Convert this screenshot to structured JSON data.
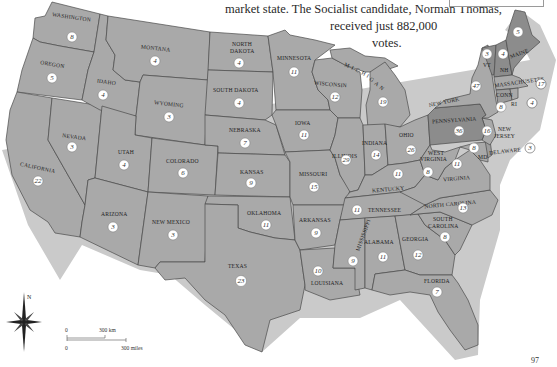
{
  "caption": {
    "lines": [
      "market state. The Socialist candidate, Norman Thomas,",
      "received just 882,000",
      "votes."
    ]
  },
  "colors": {
    "land": "#a9a9a9",
    "hoover_states": "#8c8c8c",
    "coast_halo": "#c9c9c9",
    "border": "#4a4a4a",
    "circle_fill": "#ffffff"
  },
  "states": [
    {
      "name": "WASHINGTON",
      "votes": "8"
    },
    {
      "name": "OREGON",
      "votes": "5"
    },
    {
      "name": "CALIFORNIA",
      "votes": "22"
    },
    {
      "name": "IDAHO",
      "votes": "4"
    },
    {
      "name": "NEVADA",
      "votes": "3"
    },
    {
      "name": "MONTANA",
      "votes": "4"
    },
    {
      "name": "WYOMING",
      "votes": "3"
    },
    {
      "name": "UTAH",
      "votes": "4"
    },
    {
      "name": "ARIZONA",
      "votes": "3"
    },
    {
      "name": "COLORADO",
      "votes": "6"
    },
    {
      "name": "NEW MEXICO",
      "votes": "3"
    },
    {
      "name": "NORTH DAKOTA",
      "votes": "4"
    },
    {
      "name": "SOUTH DAKOTA",
      "votes": "4"
    },
    {
      "name": "NEBRASKA",
      "votes": "7"
    },
    {
      "name": "KANSAS",
      "votes": "9"
    },
    {
      "name": "OKLAHOMA",
      "votes": "11"
    },
    {
      "name": "TEXAS",
      "votes": "23"
    },
    {
      "name": "MINNESOTA",
      "votes": "11"
    },
    {
      "name": "IOWA",
      "votes": "11"
    },
    {
      "name": "MISSOURI",
      "votes": "15"
    },
    {
      "name": "ARKANSAS",
      "votes": "9"
    },
    {
      "name": "LOUISIANA",
      "votes": "10"
    },
    {
      "name": "WISCONSIN",
      "votes": "12"
    },
    {
      "name": "MICHIGAN",
      "votes": "19"
    },
    {
      "name": "ILLINOIS",
      "votes": "29"
    },
    {
      "name": "INDIANA",
      "votes": "14"
    },
    {
      "name": "OHIO",
      "votes": "26"
    },
    {
      "name": "KENTUCKY",
      "votes": "11"
    },
    {
      "name": "TENNESSEE",
      "votes": "11"
    },
    {
      "name": "MISSISSIPPI",
      "votes": "9"
    },
    {
      "name": "ALABAMA",
      "votes": "11"
    },
    {
      "name": "GEORGIA",
      "votes": "12"
    },
    {
      "name": "FLORIDA",
      "votes": "7"
    },
    {
      "name": "SOUTH CAROLINA",
      "votes": "8"
    },
    {
      "name": "NORTH CAROLINA",
      "votes": "13"
    },
    {
      "name": "VIRGINIA",
      "votes": "11"
    },
    {
      "name": "WEST VIRGINIA",
      "votes": "8"
    },
    {
      "name": "PENNSYLVANIA",
      "votes": "36"
    },
    {
      "name": "NEW YORK",
      "votes": "47"
    },
    {
      "name": "NEW JERSEY",
      "votes": "16"
    },
    {
      "name": "DELAWARE",
      "votes": "3"
    },
    {
      "name": "MD",
      "votes": "8"
    },
    {
      "name": "VT",
      "votes": "3"
    },
    {
      "name": "NH",
      "votes": "4"
    },
    {
      "name": "MAINE",
      "votes": "5"
    },
    {
      "name": "MASSACHUSETTS",
      "votes": "17"
    },
    {
      "name": "CONN",
      "votes": "8"
    },
    {
      "name": "RI",
      "votes": "4"
    }
  ],
  "labels": {
    "south_dakota_line": "SOUTH DAKOTA",
    "north_dakota_1": "NORTH",
    "north_dakota_2": "DAKOTA",
    "new_jersey_1": "NEW",
    "new_jersey_2": "JERSEY",
    "west_virginia_1": "WEST",
    "west_virginia_2": "VIRGINIA",
    "south_carolina_1": "SOUTH",
    "south_carolina_2": "CAROLINA",
    "michigan_letters": [
      "M",
      "I",
      "C",
      "H",
      "I",
      "G",
      "A",
      "N"
    ]
  },
  "compass": {
    "north_label": "N"
  },
  "scale": {
    "km_zero": "0",
    "km_label": "300 km",
    "mi_zero": "0",
    "mi_label": "300 miles"
  },
  "page_number": "97"
}
